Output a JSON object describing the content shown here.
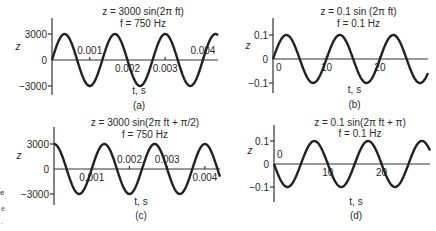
{
  "chart_data": [
    {
      "id": "a",
      "type": "line",
      "title": "z = 3000 sin(2π ft)",
      "subtitle": "f = 750 Hz",
      "function": {
        "amplitude": 3000,
        "frequency": 750,
        "phase": 0
      },
      "xlabel": "t, s",
      "ylabel": "z",
      "panel_label": "(a)",
      "xlim": [
        0,
        0.0044
      ],
      "ylim": [
        -3000,
        3000
      ],
      "xticks": [
        {
          "value": 0.001,
          "label": "0.001",
          "pos": "above"
        },
        {
          "value": 0.002,
          "label": "0.002",
          "pos": "below"
        },
        {
          "value": 0.003,
          "label": "0.003",
          "pos": "below"
        },
        {
          "value": 0.004,
          "label": "0.004",
          "pos": "above"
        }
      ],
      "yticks": [
        {
          "value": 3000,
          "label": "3000"
        },
        {
          "value": 0,
          "label": "0"
        },
        {
          "value": -3000,
          "label": "−3000"
        }
      ]
    },
    {
      "id": "b",
      "type": "line",
      "title": "z = 0.1 sin (2π ft)",
      "subtitle": "f = 0.1 Hz",
      "function": {
        "amplitude": 0.1,
        "frequency": 0.1,
        "phase": 0
      },
      "xlabel": "t, s",
      "ylabel": "z",
      "panel_label": "(b)",
      "xlim": [
        0,
        29
      ],
      "ylim": [
        -0.1,
        0.1
      ],
      "xticks": [
        {
          "value": 0,
          "label": "0",
          "pos": "below"
        },
        {
          "value": 10,
          "label": "10",
          "pos": "below"
        },
        {
          "value": 20,
          "label": "20",
          "pos": "below"
        }
      ],
      "yticks": [
        {
          "value": 0.1,
          "label": "0.1"
        },
        {
          "value": 0,
          "label": "0"
        },
        {
          "value": -0.1,
          "label": "−0.1"
        }
      ]
    },
    {
      "id": "c",
      "type": "line",
      "title": "z = 3000 sin(2π ft + π/2)",
      "subtitle": "f = 750 Hz",
      "function": {
        "amplitude": 3000,
        "frequency": 750,
        "phase": 1.5707963
      },
      "xlabel": "t, s",
      "ylabel": "z",
      "panel_label": "(c)",
      "xlim": [
        0,
        0.0044
      ],
      "ylim": [
        -3000,
        3000
      ],
      "xticks": [
        {
          "value": 0.001,
          "label": "0.001",
          "pos": "below"
        },
        {
          "value": 0.002,
          "label": "0.002",
          "pos": "above"
        },
        {
          "value": 0.003,
          "label": "0.003",
          "pos": "above"
        },
        {
          "value": 0.004,
          "label": "0.004",
          "pos": "below"
        }
      ],
      "yticks": [
        {
          "value": 3000,
          "label": "3000"
        },
        {
          "value": 0,
          "label": "0"
        },
        {
          "value": -3000,
          "label": "−3000"
        }
      ]
    },
    {
      "id": "d",
      "type": "line",
      "title": "z = 0.1 sin(2π ft + π)",
      "subtitle": "f = 0.1 Hz",
      "function": {
        "amplitude": 0.1,
        "frequency": 0.1,
        "phase": 3.1415927
      },
      "xlabel": "t, s",
      "ylabel": "z",
      "panel_label": "(d)",
      "xlim": [
        0,
        29
      ],
      "ylim": [
        -0.1,
        0.1
      ],
      "xticks": [
        {
          "value": 0,
          "label": "0",
          "pos": "above"
        },
        {
          "value": 10,
          "label": "10",
          "pos": "below"
        },
        {
          "value": 20,
          "label": "20",
          "pos": "below"
        }
      ],
      "yticks": [
        {
          "value": 0.1,
          "label": "0.1"
        },
        {
          "value": 0,
          "label": "0"
        },
        {
          "value": -0.1,
          "label": "−0.1"
        }
      ]
    }
  ],
  "edge_fragments": [
    "e",
    "e",
    "."
  ]
}
